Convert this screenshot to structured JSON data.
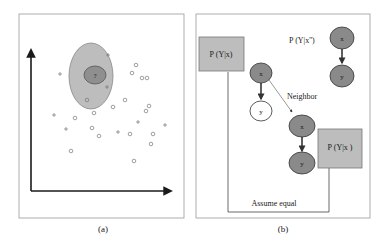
{
  "panel_a": {
    "caption": "(a)",
    "query_point_label": "?",
    "colors": {
      "outer_ellipse": "#bdbdbd",
      "inner_ellipse": "#8f8f8f",
      "axis": "#1a1a1a",
      "points": "#777777"
    },
    "circle_points": [
      [
        136,
        65
      ],
      [
        132,
        73
      ],
      [
        142,
        78
      ],
      [
        147,
        78
      ],
      [
        87,
        100
      ],
      [
        125,
        100
      ],
      [
        113,
        107
      ],
      [
        94,
        113
      ],
      [
        149,
        106
      ],
      [
        146,
        111
      ],
      [
        75,
        118
      ],
      [
        92,
        128
      ],
      [
        99,
        136
      ],
      [
        130,
        134
      ],
      [
        153,
        134
      ],
      [
        151,
        144
      ],
      [
        71,
        151
      ],
      [
        134,
        161
      ]
    ],
    "plus_points": [
      [
        60,
        74
      ],
      [
        108,
        55
      ],
      [
        107,
        87
      ],
      [
        54,
        115
      ],
      [
        66,
        129
      ],
      [
        138,
        122
      ],
      [
        165,
        125
      ],
      [
        118,
        132
      ]
    ]
  },
  "panel_b": {
    "caption": "(b)",
    "box_left_label": "P (Y|x)",
    "box_right_label": "P (Y|x )",
    "top_right_label": "P (Y|x'')",
    "neighbor_label": "Neighbor",
    "assume_equal_label": "Assume equal",
    "node_x_label": "x",
    "node_y_label": "y",
    "colors": {
      "box_fill": "#bdbdbd",
      "node_fill": "#8a8a8a",
      "node_empty": "#ffffff",
      "stroke": "#333333"
    }
  }
}
